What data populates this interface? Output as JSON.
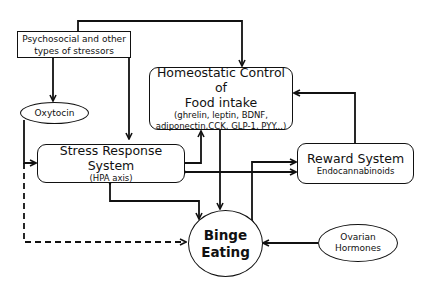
{
  "diagram": {
    "nodes": {
      "stressors": {
        "label": "Psychosocial and other types of stressors",
        "line1": "Psychosocial and other",
        "line2": "types of stressors"
      },
      "oxytocin": {
        "label": "Oxytocin"
      },
      "homeostatic": {
        "title_line1": "Homeostatic Control of",
        "title_line2": "Food intake",
        "detail_line1": "(ghrelin, leptin,  BDNF,",
        "detail_line2": "adiponectin,CCK, GLP-1, PYY...)"
      },
      "stress_response": {
        "title": "Stress Response System",
        "subtitle": "(HPA axis)"
      },
      "reward": {
        "title": "Reward System",
        "subtitle": "Endocannabinoids"
      },
      "binge": {
        "line1": "Binge",
        "line2": "Eating"
      },
      "ovarian": {
        "line1": "Ovarian",
        "line2": "Hormones"
      }
    },
    "edges": [
      {
        "from": "stressors",
        "to": "homeostatic",
        "style": "solid"
      },
      {
        "from": "stressors",
        "to": "oxytocin",
        "style": "solid"
      },
      {
        "from": "stressors",
        "to": "stress_response",
        "style": "solid"
      },
      {
        "from": "oxytocin",
        "to": "stress_response",
        "style": "solid"
      },
      {
        "from": "oxytocin",
        "to": "binge",
        "style": "dashed"
      },
      {
        "from": "stress_response",
        "to": "homeostatic",
        "style": "solid"
      },
      {
        "from": "stress_response",
        "to": "reward",
        "style": "solid",
        "bidirectional": true
      },
      {
        "from": "stress_response",
        "to": "binge",
        "style": "solid",
        "bidirectional": true
      },
      {
        "from": "homeostatic",
        "to": "binge",
        "style": "solid"
      },
      {
        "from": "reward",
        "to": "homeostatic",
        "style": "solid"
      },
      {
        "from": "reward",
        "to": "binge",
        "style": "solid",
        "bidirectional": true
      },
      {
        "from": "ovarian",
        "to": "binge",
        "style": "solid"
      }
    ],
    "colors": {
      "stroke": "#111111",
      "background": "#ffffff"
    }
  }
}
